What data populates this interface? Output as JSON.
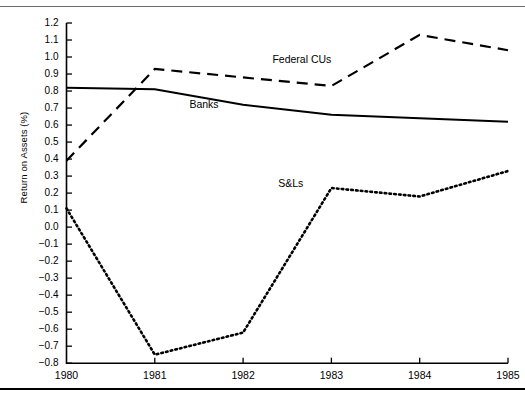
{
  "chart_data": {
    "type": "line",
    "title": "",
    "xlabel": "",
    "ylabel": "Return on Assets (%)",
    "x": [
      1980,
      1981,
      1982,
      1983,
      1984,
      1985
    ],
    "xtick_labels": [
      "1980",
      "1981",
      "1982",
      "1983",
      "1984",
      "1985"
    ],
    "xlim": [
      1980,
      1985
    ],
    "ylim": [
      -0.8,
      1.2
    ],
    "ytick_labels": [
      "1.2",
      "1.1",
      "1.0",
      "0.9",
      "0.8",
      "0.7",
      "0.6",
      "0.5",
      "0.4",
      "0.3",
      "0.2",
      "0.1",
      "0.0",
      "−0.1",
      "−0.2",
      "−0.3",
      "−0.4",
      "−0.5",
      "−0.6",
      "−0.7",
      "−0.8"
    ],
    "ytick_values": [
      1.2,
      1.1,
      1.0,
      0.9,
      0.8,
      0.7,
      0.6,
      0.5,
      0.4,
      0.3,
      0.2,
      0.1,
      0.0,
      -0.1,
      -0.2,
      -0.3,
      -0.4,
      -0.5,
      -0.6,
      -0.7,
      -0.8
    ],
    "grid": false,
    "legend_position": "inline-annotations",
    "series": [
      {
        "name": "Federal CUs",
        "style": "dashed",
        "color": "#000000",
        "values": [
          0.39,
          0.93,
          0.88,
          0.83,
          1.13,
          1.04
        ],
        "label_x": 1983.0,
        "label_y": 0.98
      },
      {
        "name": "Banks",
        "style": "solid",
        "color": "#000000",
        "values": [
          0.82,
          0.81,
          0.72,
          0.66,
          0.64,
          0.62
        ],
        "label_x": 1981.72,
        "label_y": 0.72
      },
      {
        "name": "S&Ls",
        "style": "dotted",
        "color": "#000000",
        "values": [
          0.11,
          -0.75,
          -0.62,
          0.23,
          0.18,
          0.33
        ],
        "label_x": 1982.68,
        "label_y": 0.255
      }
    ]
  },
  "axis": {
    "y_title": "Return on Assets (%)"
  }
}
